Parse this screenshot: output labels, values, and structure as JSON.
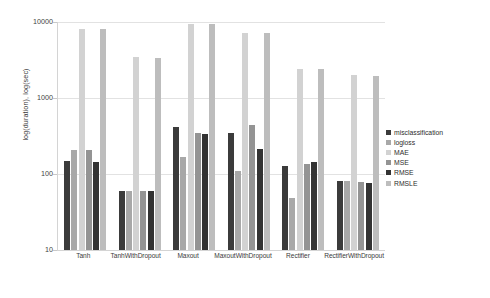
{
  "chart_data": {
    "type": "bar",
    "title": "",
    "xlabel": "",
    "ylabel": "log(duration), log(sec)",
    "yscale": "log",
    "ylim": [
      10,
      10000
    ],
    "yticks": [
      10,
      100,
      1000,
      10000
    ],
    "ytick_labels": [
      "10",
      "100",
      "1000",
      "10000"
    ],
    "grid": true,
    "legend_position": "right",
    "categories": [
      "Tanh",
      "TanhWithDropout",
      "Maxout",
      "MaxoutWithDropout",
      "Rectifier",
      "RectifierWithDropout"
    ],
    "series": [
      {
        "name": "misclassification",
        "color": "#3b3b3b",
        "values": [
          150,
          60,
          420,
          350,
          128,
          80
        ]
      },
      {
        "name": "logloss",
        "color": "#a8a8a8",
        "values": [
          205,
          60,
          170,
          110,
          48,
          80
        ]
      },
      {
        "name": "MAE",
        "color": "#d2d2d2",
        "values": [
          8200,
          3500,
          9300,
          7200,
          2400,
          2000
        ]
      },
      {
        "name": "MSE",
        "color": "#949494",
        "values": [
          205,
          60,
          350,
          440,
          135,
          78
        ]
      },
      {
        "name": "RMSE",
        "color": "#333333",
        "values": [
          145,
          60,
          340,
          215,
          145,
          76
        ]
      },
      {
        "name": "RMSLE",
        "color": "#bdbdbd",
        "values": [
          8200,
          3400,
          9300,
          7100,
          2400,
          1950
        ]
      }
    ]
  }
}
